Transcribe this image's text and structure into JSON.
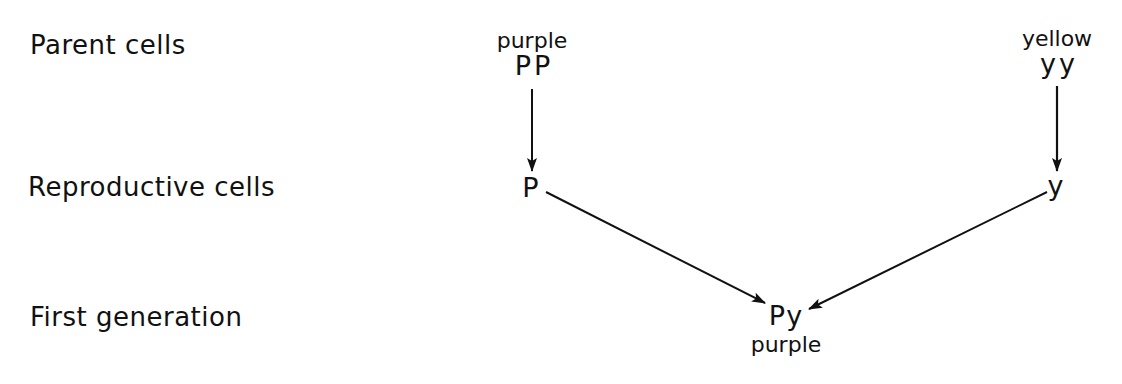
{
  "row_labels": {
    "parent": "Parent cells",
    "reproductive": "Reproductive cells",
    "first_generation": "First generation"
  },
  "left_parent": {
    "phenotype": "purple",
    "genotype": "PP",
    "gamete": "P"
  },
  "right_parent": {
    "phenotype": "yellow",
    "genotype": "yy",
    "gamete": "y"
  },
  "offspring": {
    "genotype": "Py",
    "phenotype": "purple"
  },
  "colors": {
    "ink": "#111111",
    "background": "#ffffff"
  }
}
